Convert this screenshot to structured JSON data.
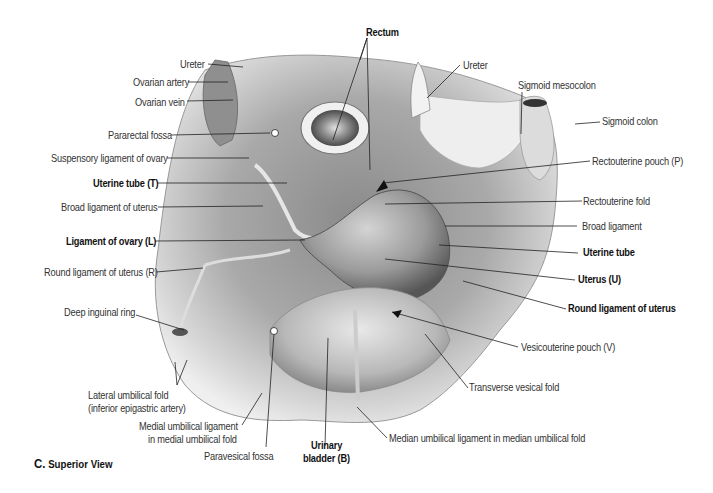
{
  "figure": {
    "caption_letter": "C.",
    "caption_text": "Superior View"
  },
  "labels": {
    "rectum": "Rectum",
    "ureter_left": "Ureter",
    "ovarian_artery": "Ovarian artery",
    "ovarian_vein": "Ovarian vein",
    "pararectal_fossa": "Pararectal fossa",
    "suspensory_ligament": "Suspensory ligament of ovary",
    "uterine_tube_t": "Uterine tube (T)",
    "broad_ligament_of_uterus": "Broad ligament of uterus",
    "ligament_of_ovary": "Ligament of ovary (L)",
    "round_ligament_r": "Round ligament of uterus (R)",
    "deep_inguinal_ring": "Deep inguinal ring",
    "lateral_umbilical_fold_1": "Lateral umbilical fold",
    "lateral_umbilical_fold_2": "(inferior epigastric artery)",
    "medial_umbilical_1": "Medial umbilical ligament",
    "medial_umbilical_2": "in medial umbilical fold",
    "paravesical_fossa": "Paravesical fossa",
    "urinary_bladder_1": "Urinary",
    "urinary_bladder_2": "bladder (B)",
    "median_umbilical": "Median umbilical ligament in median umbilical fold",
    "ureter_right": "Ureter",
    "sigmoid_mesocolon": "Sigmoid mesocolon",
    "sigmoid_colon": "Sigmoid colon",
    "rectouterine_pouch": "Rectouterine pouch (P)",
    "rectouterine_fold": "Rectouterine fold",
    "broad_ligament": "Broad ligament",
    "uterine_tube": "Uterine tube",
    "uterus": "Uterus (U)",
    "round_ligament": "Round ligament of uterus",
    "vesicouterine_pouch": "Vesicouterine pouch (V)",
    "transverse_vesical_fold": "Transverse vesical fold"
  }
}
